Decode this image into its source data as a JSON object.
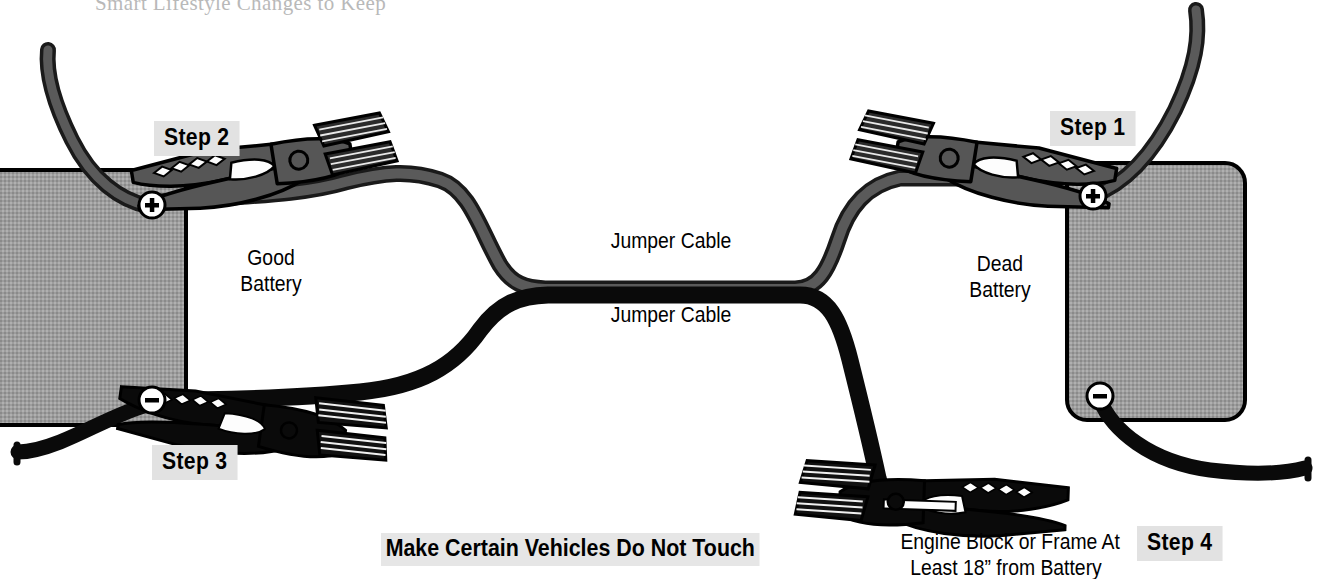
{
  "page": {
    "width": 1325,
    "height": 579,
    "background": "#ffffff",
    "title_fragment_cut_off_at_top": "Smart Lifestyle Changes to Keep"
  },
  "colors": {
    "battery_fill": "#9a9a9a",
    "battery_stroke": "#000000",
    "cable_black": "#0a0a0a",
    "cable_gray": "#4f4f4f",
    "clamp_gray": "#565656",
    "clamp_black": "#0a0a0a",
    "chip_background": "#e2e2e2",
    "text": "#000000"
  },
  "batteries": [
    {
      "id": "good-battery",
      "label_line1": "Good",
      "label_line2": "Battery",
      "terminals": [
        {
          "id": "good-positive",
          "symbol": "+",
          "x": 152,
          "y": 205
        },
        {
          "id": "good-negative",
          "symbol": "−",
          "x": 152,
          "y": 400
        }
      ]
    },
    {
      "id": "dead-battery",
      "label_line1": "Dead",
      "label_line2": "Battery",
      "terminals": [
        {
          "id": "dead-positive",
          "symbol": "+",
          "x": 1093,
          "y": 196
        },
        {
          "id": "dead-negative",
          "symbol": "−",
          "x": 1100,
          "y": 396
        }
      ]
    }
  ],
  "steps": [
    {
      "id": "step-1",
      "label": "Step 1",
      "x": 1050,
      "y": 111
    },
    {
      "id": "step-2",
      "label": "Step 2",
      "x": 154,
      "y": 121
    },
    {
      "id": "step-3",
      "label": "Step 3",
      "x": 152,
      "y": 445
    },
    {
      "id": "step-4",
      "label": "Step 4",
      "x": 1137,
      "y": 526
    }
  ],
  "cable_labels": [
    {
      "id": "jumper-cable-upper",
      "text": "Jumper Cable",
      "x": 614,
      "y": 229
    },
    {
      "id": "jumper-cable-lower",
      "text": "Jumper Cable",
      "x": 614,
      "y": 303
    }
  ],
  "annotations": {
    "warning": "Make Certain Vehicles Do Not Touch",
    "engine_block_line1": "Engine Block or Frame At",
    "engine_block_line2": "Least 18” from Battery"
  },
  "clamps": [
    {
      "id": "clamp-step-1",
      "attached_to": "dead-battery-positive",
      "color": "gray"
    },
    {
      "id": "clamp-step-2",
      "attached_to": "good-battery-positive",
      "color": "gray"
    },
    {
      "id": "clamp-step-3",
      "attached_to": "good-battery-negative",
      "color": "black"
    },
    {
      "id": "clamp-step-4",
      "attached_to": "engine-block",
      "color": "black"
    }
  ]
}
